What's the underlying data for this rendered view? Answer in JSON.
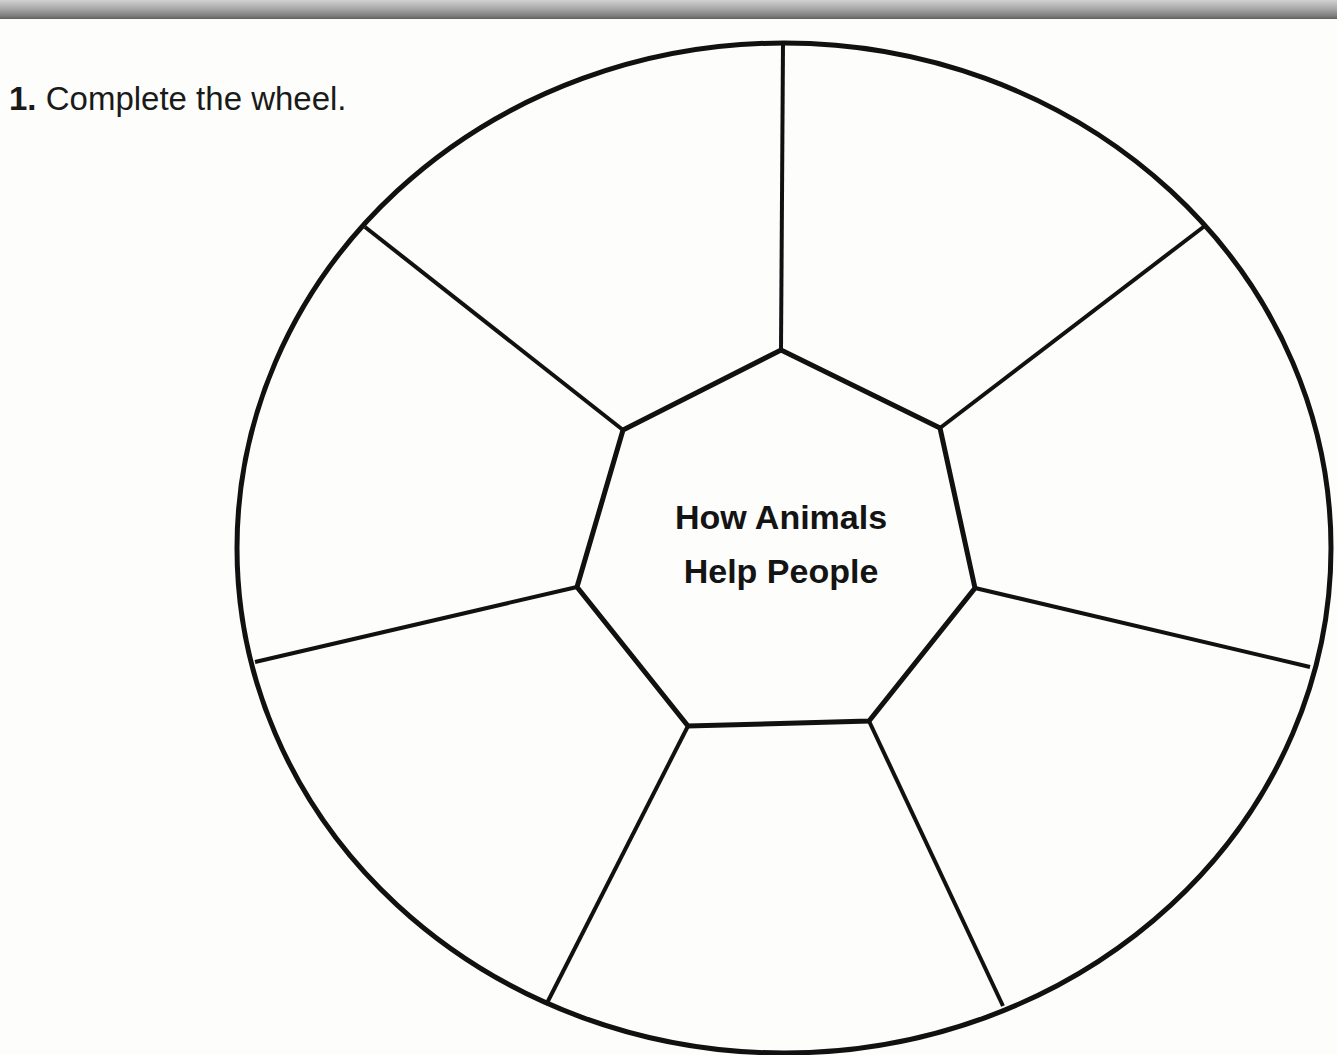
{
  "header": {
    "bar": "gray-gradient-strip"
  },
  "instruction": {
    "number": "1.",
    "text": "Complete the wheel."
  },
  "wheel": {
    "center_label": {
      "line1": "How Animals",
      "line2": "Help People"
    },
    "segments": 7,
    "segment_contents": [
      "",
      "",
      "",
      "",
      "",
      "",
      ""
    ],
    "stroke_color": "#111111",
    "background_color": "#fdfdfc"
  }
}
